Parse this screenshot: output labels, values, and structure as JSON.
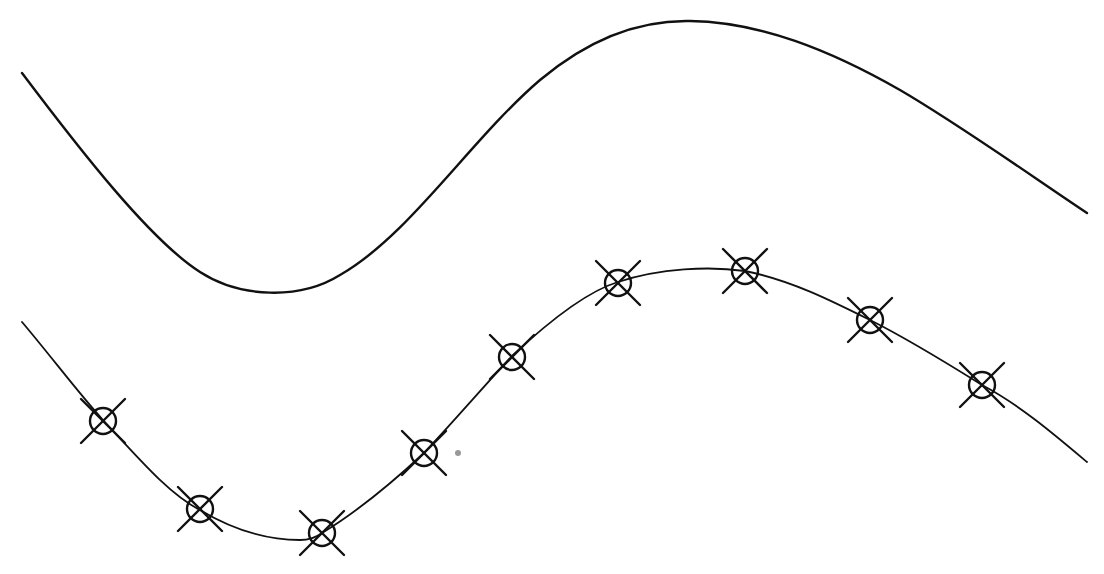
{
  "diagram": {
    "width": 1104,
    "height": 574,
    "background": "#ffffff",
    "stroke_color": "#111111",
    "curves": [
      {
        "name": "upper-curve",
        "stroke_width": 2.4,
        "d": "M 22 73 C 80 150, 150 240, 200 272 C 240 298, 300 300, 340 275 C 410 235, 470 140, 540 80 C 590 38, 640 20, 690 21 C 760 22, 830 50, 900 90 C 960 125, 1030 175, 1087 213"
      },
      {
        "name": "lower-curve",
        "stroke_width": 1.8,
        "d": "M 22 322 C 50 355, 80 395, 103 420 C 140 460, 170 495, 200 510 C 230 528, 265 540, 300 540 C 310 540, 318 536, 322 533 C 360 510, 395 480, 424 453 C 455 420, 485 385, 512 356 C 545 325, 585 292, 618 282 C 660 268, 710 266, 745 271 C 790 280, 830 300, 870 320 C 910 340, 950 365, 982 385 C 1020 405, 1055 435, 1087 462"
      }
    ],
    "markers": [
      {
        "x": 103,
        "y": 421
      },
      {
        "x": 200,
        "y": 509
      },
      {
        "x": 322,
        "y": 533
      },
      {
        "x": 424,
        "y": 453
      },
      {
        "x": 512,
        "y": 357
      },
      {
        "x": 618,
        "y": 283
      },
      {
        "x": 745,
        "y": 271
      },
      {
        "x": 870,
        "y": 320
      },
      {
        "x": 982,
        "y": 385
      }
    ],
    "marker_style": {
      "circle_radius": 13,
      "x_arm": 22,
      "stroke_width": 2.4
    },
    "stray_dot": {
      "x": 458,
      "y": 453,
      "r": 3,
      "color": "#999999"
    }
  }
}
